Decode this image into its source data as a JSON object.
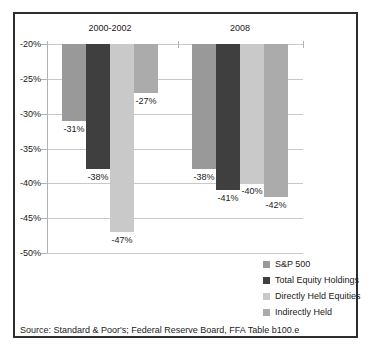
{
  "frame": {
    "border_color": "#2e2e2e",
    "background_color": "#ffffff"
  },
  "chart_data": {
    "type": "bar",
    "title": "",
    "categories": [
      "2000-2002",
      "2008"
    ],
    "series": [
      {
        "name": "S&P 500",
        "color": "#999999",
        "values": [
          -31,
          -38
        ]
      },
      {
        "name": "Total Equity Holdings",
        "color": "#3f3f3f",
        "values": [
          -38,
          -41
        ]
      },
      {
        "name": "Directly Held Equities",
        "color": "#c9c9c9",
        "values": [
          -47,
          -40
        ]
      },
      {
        "name": "Indirectly Held",
        "color": "#ababab",
        "values": [
          -27,
          -42
        ]
      }
    ],
    "data_labels": [
      [
        "-31%",
        "-38%",
        "-47%",
        "-27%"
      ],
      [
        "-38%",
        "-41%",
        "-40%",
        "-42%"
      ]
    ],
    "xlabel": "",
    "ylabel": "",
    "y_axis": {
      "ticks": [
        "-20%",
        "-25%",
        "-30%",
        "-35%",
        "-40%",
        "-45%",
        "-50%"
      ],
      "max": -20,
      "min": -50
    },
    "grid": true,
    "gridline_color": "#c9c9c9",
    "axis_line_color": "#b3b3b3",
    "legend_position": "bottom-right"
  },
  "legend": {
    "items": [
      "S&P 500",
      "Total Equity Holdings",
      "Directly Held Equities",
      "Indirectly Held"
    ]
  },
  "source_note": "Source:  Standard & Poor's; Federal Reserve Board, FFA Table b100.e"
}
